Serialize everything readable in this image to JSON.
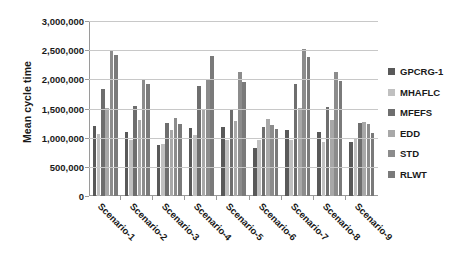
{
  "chart_data": {
    "type": "bar",
    "title": "",
    "xlabel": "",
    "ylabel": "Mean cycle time",
    "ylim": [
      0,
      3000000
    ],
    "ytick_step": 500000,
    "ytick_labels": [
      "3,000,000",
      "2,500,000",
      "2,000,000",
      "1,500,000",
      "1,000,000",
      "500,000",
      "0"
    ],
    "ytick_values": [
      3000000,
      2500000,
      2000000,
      1500000,
      1000000,
      500000,
      0
    ],
    "grid": true,
    "legend_position": "right",
    "categories": [
      "Scenario-1",
      "Scenario-2",
      "Scenario-3",
      "Scenario-4",
      "Scenario-5",
      "Scenario-6",
      "Scenario-7",
      "Scenario-8",
      "Scenario-9"
    ],
    "series": [
      {
        "name": "GPCRG-1",
        "color": "#595959",
        "values": [
          1200000,
          1100000,
          880000,
          1170000,
          1190000,
          830000,
          1130000,
          1090000,
          930000
        ]
      },
      {
        "name": "MHAFLC",
        "color": "#c0c0c0",
        "values": [
          1060000,
          960000,
          900000,
          1050000,
          960000,
          960000,
          960000,
          930000,
          970000
        ]
      },
      {
        "name": "MFEFS",
        "color": "#6e6e6e",
        "values": [
          1840000,
          1550000,
          1260000,
          1880000,
          1500000,
          1180000,
          1920000,
          1520000,
          1250000
        ]
      },
      {
        "name": "EDD",
        "color": "#a8a8a8",
        "values": [
          1510000,
          1300000,
          1130000,
          1490000,
          1290000,
          1320000,
          1510000,
          1300000,
          1270000
        ]
      },
      {
        "name": "STD",
        "color": "#8c8c8c",
        "values": [
          2500000,
          2010000,
          1340000,
          2000000,
          2120000,
          1220000,
          2520000,
          2120000,
          1230000
        ]
      },
      {
        "name": "RLWT",
        "color": "#7a7a7a",
        "values": [
          2410000,
          1920000,
          1230000,
          2400000,
          1950000,
          1150000,
          2380000,
          1980000,
          1080000
        ]
      }
    ]
  },
  "legend": {
    "items": [
      {
        "label": "GPCRG-1"
      },
      {
        "label": "MHAFLC"
      },
      {
        "label": "MFEFS"
      },
      {
        "label": "EDD"
      },
      {
        "label": "STD"
      },
      {
        "label": "RLWT"
      }
    ]
  }
}
